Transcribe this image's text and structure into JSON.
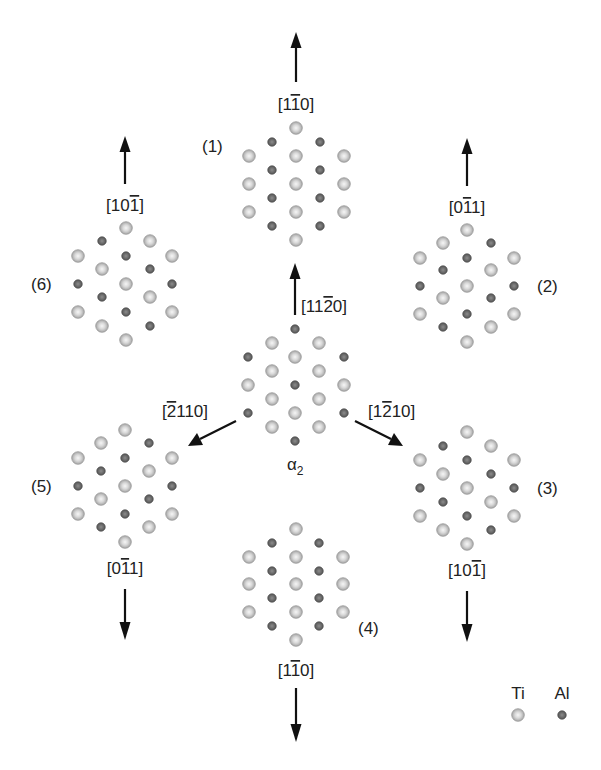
{
  "diagram": {
    "title": "",
    "colors": {
      "ti_fill_outer": "#a8a8a8",
      "ti_fill_inner": "#f2f2f2",
      "al_fill_outer": "#555555",
      "al_fill_inner": "#8a8a8a",
      "arrow": "#111111"
    },
    "legend": {
      "ti_label": "Ti",
      "al_label": "Al"
    },
    "center": {
      "label_base": "α",
      "label_sub": "2",
      "direction_up": {
        "pre": "[11",
        "bar": "2",
        "post": "0]"
      },
      "direction_left": {
        "pre": "[",
        "bar": "2",
        "post": "110]"
      },
      "direction_right": {
        "pre": "[1",
        "bar": "2",
        "post": "10]"
      }
    },
    "variants": [
      {
        "id": "1",
        "label": "(1)",
        "direction": {
          "pre": "[1",
          "bar": "1",
          "post": "0]"
        },
        "arrow": "up"
      },
      {
        "id": "2",
        "label": "(2)",
        "direction": {
          "pre": "[0",
          "bar": "1",
          "post": "1]"
        },
        "arrow": "up"
      },
      {
        "id": "3",
        "label": "(3)",
        "direction": {
          "pre": "[10",
          "bar": "1",
          "post": "]"
        },
        "arrow": "down"
      },
      {
        "id": "4",
        "label": "(4)",
        "direction": {
          "pre": "[1",
          "bar": "1",
          "post": "0]"
        },
        "arrow": "down"
      },
      {
        "id": "5",
        "label": "(5)",
        "direction": {
          "pre": "[0",
          "bar": "1",
          "post": "1]"
        },
        "arrow": "down"
      },
      {
        "id": "6",
        "label": "(6)",
        "direction": {
          "pre": "[10",
          "bar": "1",
          "post": "]"
        },
        "arrow": "up"
      }
    ],
    "atoms": {
      "cluster_1": {
        "ti": [
          [
            296,
            128
          ],
          [
            249,
            156
          ],
          [
            296,
            156
          ],
          [
            344,
            156
          ],
          [
            249,
            184
          ],
          [
            296,
            184
          ],
          [
            344,
            184
          ],
          [
            249,
            212
          ],
          [
            296,
            212
          ],
          [
            344,
            212
          ],
          [
            296,
            240
          ]
        ],
        "al": [
          [
            272,
            142
          ],
          [
            320,
            142
          ],
          [
            272,
            170
          ],
          [
            320,
            170
          ],
          [
            272,
            198
          ],
          [
            320,
            198
          ],
          [
            272,
            226
          ],
          [
            320,
            226
          ]
        ]
      },
      "cluster_2": {
        "ti": [
          [
            467,
            230
          ],
          [
            443,
            243
          ],
          [
            420,
            258
          ],
          [
            514,
            258
          ],
          [
            491,
            270
          ],
          [
            467,
            286
          ],
          [
            443,
            298
          ],
          [
            420,
            314
          ],
          [
            514,
            314
          ],
          [
            491,
            327
          ],
          [
            467,
            342
          ]
        ],
        "al": [
          [
            491,
            243
          ],
          [
            467,
            258
          ],
          [
            443,
            270
          ],
          [
            420,
            286
          ],
          [
            514,
            286
          ],
          [
            491,
            298
          ],
          [
            467,
            314
          ],
          [
            443,
            327
          ]
        ]
      },
      "cluster_3": {
        "ti": [
          [
            467,
            432
          ],
          [
            491,
            446
          ],
          [
            420,
            460
          ],
          [
            514,
            460
          ],
          [
            443,
            474
          ],
          [
            467,
            488
          ],
          [
            491,
            502
          ],
          [
            420,
            516
          ],
          [
            514,
            516
          ],
          [
            443,
            530
          ],
          [
            467,
            544
          ]
        ],
        "al": [
          [
            443,
            446
          ],
          [
            467,
            460
          ],
          [
            491,
            474
          ],
          [
            420,
            488
          ],
          [
            514,
            488
          ],
          [
            443,
            502
          ],
          [
            467,
            516
          ],
          [
            491,
            530
          ]
        ]
      },
      "cluster_4": {
        "ti": [
          [
            296,
            529
          ],
          [
            249,
            557
          ],
          [
            296,
            557
          ],
          [
            343,
            557
          ],
          [
            249,
            584
          ],
          [
            296,
            584
          ],
          [
            343,
            584
          ],
          [
            249,
            612
          ],
          [
            296,
            612
          ],
          [
            343,
            612
          ],
          [
            296,
            640
          ]
        ],
        "al": [
          [
            272,
            543
          ],
          [
            319,
            543
          ],
          [
            272,
            571
          ],
          [
            319,
            571
          ],
          [
            272,
            598
          ],
          [
            319,
            598
          ],
          [
            272,
            626
          ],
          [
            319,
            626
          ]
        ]
      },
      "cluster_5": {
        "ti": [
          [
            125,
            430
          ],
          [
            101,
            443
          ],
          [
            78,
            458
          ],
          [
            172,
            458
          ],
          [
            149,
            471
          ],
          [
            125,
            486
          ],
          [
            101,
            499
          ],
          [
            78,
            514
          ],
          [
            172,
            514
          ],
          [
            149,
            527
          ],
          [
            125,
            542
          ]
        ],
        "al": [
          [
            149,
            443
          ],
          [
            125,
            458
          ],
          [
            101,
            471
          ],
          [
            78,
            486
          ],
          [
            172,
            486
          ],
          [
            149,
            499
          ],
          [
            125,
            514
          ],
          [
            101,
            527
          ]
        ]
      },
      "cluster_6": {
        "ti": [
          [
            126,
            228
          ],
          [
            150,
            241
          ],
          [
            78,
            256
          ],
          [
            172,
            256
          ],
          [
            102,
            269
          ],
          [
            126,
            284
          ],
          [
            150,
            297
          ],
          [
            78,
            312
          ],
          [
            172,
            312
          ],
          [
            102,
            326
          ],
          [
            126,
            340
          ]
        ],
        "al": [
          [
            102,
            241
          ],
          [
            126,
            256
          ],
          [
            150,
            269
          ],
          [
            78,
            284
          ],
          [
            172,
            284
          ],
          [
            102,
            297
          ],
          [
            126,
            312
          ],
          [
            150,
            326
          ]
        ]
      },
      "cluster_center": {
        "ti": [
          [
            272,
            343
          ],
          [
            319,
            343
          ],
          [
            295,
            357
          ],
          [
            272,
            371
          ],
          [
            319,
            371
          ],
          [
            248,
            385
          ],
          [
            344,
            385
          ],
          [
            272,
            399
          ],
          [
            319,
            399
          ],
          [
            295,
            413
          ],
          [
            272,
            427
          ],
          [
            319,
            427
          ]
        ],
        "al": [
          [
            295,
            329
          ],
          [
            248,
            357
          ],
          [
            344,
            357
          ],
          [
            295,
            385
          ],
          [
            248,
            413
          ],
          [
            344,
            413
          ],
          [
            295,
            441
          ]
        ]
      },
      "legend": {
        "ti": [
          [
            518,
            715
          ]
        ],
        "al": [
          [
            562,
            715
          ]
        ]
      }
    }
  }
}
